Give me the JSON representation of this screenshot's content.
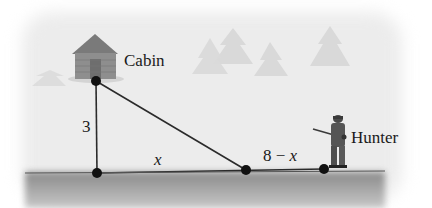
{
  "diagram": {
    "labels": {
      "cabin": "Cabin",
      "hunter": "Hunter",
      "vertical_side": "3",
      "left_base": "x",
      "right_base_num": "8 − ",
      "right_base_var": "x"
    },
    "points": {
      "cabin": [
        96,
        81
      ],
      "corner": [
        97,
        173
      ],
      "mid": [
        246,
        170
      ],
      "hunter": [
        324,
        169
      ]
    },
    "colors": {
      "line": "#2b2b2b",
      "dot": "#111111",
      "ground": "#9a9a9a",
      "background": "#ececec",
      "trees": "#d8d8d8",
      "cabin": "#8c8c8c"
    }
  }
}
